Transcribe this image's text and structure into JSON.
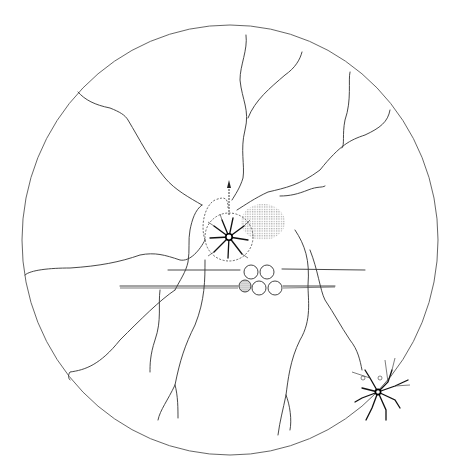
{
  "diagram": {
    "type": "neuron-schematic",
    "background": "#ffffff",
    "line_color": "#333333",
    "outer_circle": {
      "cx": 230,
      "cy": 240,
      "rx": 208,
      "ry": 215
    },
    "central_cell": {
      "cx": 229,
      "cy": 237,
      "r": 24,
      "label": ""
    },
    "peripheral_cell": {
      "cx": 378,
      "cy": 392,
      "label": ""
    },
    "axon_bundle_circles": [
      {
        "cx": 251,
        "cy": 272,
        "r": 7,
        "stippled": false
      },
      {
        "cx": 267,
        "cy": 272,
        "r": 7,
        "stippled": false
      },
      {
        "cx": 245,
        "cy": 286,
        "r": 6,
        "stippled": true
      },
      {
        "cx": 259,
        "cy": 288,
        "r": 7,
        "stippled": false
      },
      {
        "cx": 275,
        "cy": 288,
        "r": 7,
        "stippled": false
      }
    ],
    "shaded_region": {
      "cx": 263,
      "cy": 222,
      "rx": 22,
      "ry": 18,
      "pattern": "crosshatch"
    },
    "text_labels": []
  }
}
